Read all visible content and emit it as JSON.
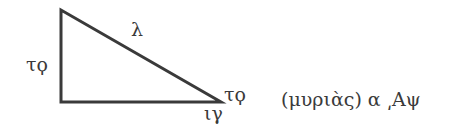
{
  "diagram": {
    "type": "right-triangle",
    "stroke_color": "#3a3a3a",
    "vertices": {
      "top": [
        61,
        10
      ],
      "right_angle": [
        61,
        102
      ],
      "acute": [
        221,
        102
      ]
    },
    "labels": {
      "vertical_side": "τϙ",
      "hypotenuse": "λ",
      "acute_vertex": "τϙ",
      "base": "ιγ"
    },
    "caption": "(μυριὰς) α ͵Αψ"
  }
}
